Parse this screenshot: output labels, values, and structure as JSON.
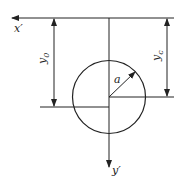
{
  "diagram": {
    "labels": {
      "x_axis": "x′",
      "y_axis": "y′",
      "y0_main": "y",
      "y0_sub": "0",
      "yc_main": "y",
      "yc_sub": "c",
      "radius": "a"
    },
    "colors": {
      "stroke": "#222222",
      "background": "#ffffff"
    }
  }
}
